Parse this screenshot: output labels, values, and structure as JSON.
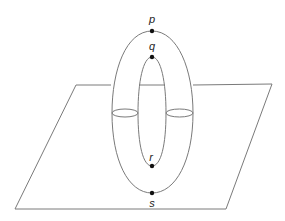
{
  "diagram": {
    "colors": {
      "line": "#7a7a7a",
      "point": "#111111",
      "label": "#222222",
      "background": "#ffffff"
    },
    "plane": {
      "corners": [
        [
          76,
          85
        ],
        [
          272,
          84
        ],
        [
          226,
          209
        ],
        [
          15,
          209
        ]
      ]
    },
    "torus": {
      "outer": {
        "cx": 152,
        "top_y": 31,
        "bottom_y": 193,
        "rx": 40
      },
      "inner": {
        "cx": 152,
        "top_y": 57,
        "bottom_y": 166,
        "rx": 14
      },
      "cross_sections": [
        {
          "name": "left",
          "cx": 125,
          "cy": 113,
          "rx": 13,
          "ry": 4
        },
        {
          "name": "right",
          "cx": 179,
          "cy": 113,
          "rx": 13,
          "ry": 4
        }
      ]
    },
    "points": [
      {
        "id": "p",
        "label": "p",
        "x": 152,
        "y": 31,
        "label_x": 152,
        "label_y": 23
      },
      {
        "id": "q",
        "label": "q",
        "x": 152,
        "y": 57,
        "label_x": 152,
        "label_y": 50
      },
      {
        "id": "r",
        "label": "r",
        "x": 152,
        "y": 166,
        "label_x": 151,
        "label_y": 160
      },
      {
        "id": "s",
        "label": "s",
        "x": 152,
        "y": 193,
        "label_x": 152,
        "label_y": 206
      }
    ]
  }
}
